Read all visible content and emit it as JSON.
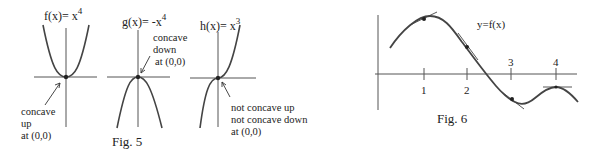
{
  "fig5": {
    "caption": "Fig. 5",
    "panels": [
      {
        "function_label": "f(x)= x",
        "exponent": "4",
        "annotation": [
          "concave",
          "up",
          "at  (0,0)"
        ]
      },
      {
        "function_label": "g(x)= -x",
        "exponent": "4",
        "annotation": [
          "concave",
          "down",
          "at  (0,0)"
        ]
      },
      {
        "function_label": "h(x)= x",
        "exponent": "3",
        "annotation": [
          "not concave up",
          "not concave down",
          "at  (0,0)"
        ]
      }
    ]
  },
  "fig6": {
    "caption": "Fig. 6",
    "curve_label": "y=f(x)",
    "x_ticks": [
      "1",
      "2",
      "3",
      "4"
    ]
  },
  "colors": {
    "ink": "#222222",
    "curve": "#444444",
    "axis": "#555555"
  }
}
